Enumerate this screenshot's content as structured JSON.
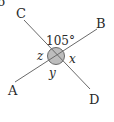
{
  "diagram": {
    "type": "intersecting-lines-angles",
    "points": {
      "A": {
        "label": "A"
      },
      "B": {
        "label": "B"
      },
      "C": {
        "label": "C"
      },
      "D": {
        "label": "D"
      }
    },
    "lines": [
      {
        "from": "A",
        "to": "B"
      },
      {
        "from": "C",
        "to": "D"
      }
    ],
    "angles": {
      "top": {
        "label": "105°",
        "between": [
          "C",
          "B"
        ]
      },
      "right": {
        "label": "x",
        "between": [
          "B",
          "D"
        ]
      },
      "bottom": {
        "label": "y",
        "between": [
          "D",
          "A"
        ]
      },
      "left": {
        "label": "z",
        "between": [
          "A",
          "C"
        ]
      }
    },
    "intersection_marker": {
      "shape": "circle",
      "fill": "#bdbdbd",
      "stroke": "#6a6a6a"
    },
    "line_color": "#6a6a6a",
    "text_color": "#2a2a2a",
    "corner_fragment": "6"
  }
}
